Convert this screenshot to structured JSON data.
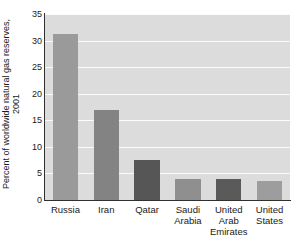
{
  "chart_data": {
    "type": "bar",
    "title": "",
    "xlabel": "",
    "ylabel": "Percent of worldwide natural gas reserves, 2001",
    "ylabel_lines": [
      "Percent of worldwide natural gas reserves,",
      "2001"
    ],
    "categories": [
      "Russia",
      "Iran",
      "Qatar",
      "Saudi Arabia",
      "United Arab Emirates",
      "United States"
    ],
    "category_lines": [
      [
        "Russia"
      ],
      [
        "Iran"
      ],
      [
        "Qatar"
      ],
      [
        "Saudi",
        "Arabia"
      ],
      [
        "United",
        "Arab",
        "Emirates"
      ],
      [
        "United",
        "States"
      ]
    ],
    "values": [
      31.2,
      17.0,
      7.5,
      4.0,
      4.0,
      3.6
    ],
    "bar_colors": [
      "#9a9a9a",
      "#838383",
      "#565656",
      "#8f8f8f",
      "#5a5a5a",
      "#9d9d9d"
    ],
    "ylim": [
      0,
      35
    ],
    "yticks": [
      0,
      5,
      10,
      15,
      20,
      25,
      30,
      35
    ],
    "ytick_labels": [
      "0",
      "5",
      "10",
      "15",
      "20",
      "25",
      "30",
      "35"
    ],
    "grid": true,
    "grid_color": "#fbfbfb",
    "plot_background": "#dcdcdc",
    "axis_color": "#303030",
    "legend": null,
    "legend_position": "none"
  }
}
